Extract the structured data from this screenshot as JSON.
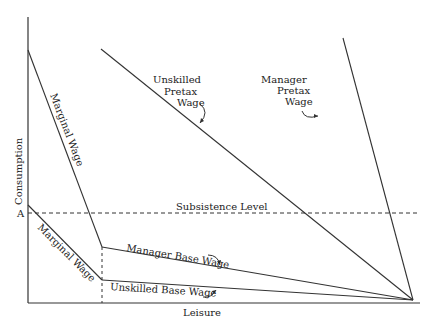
{
  "diagram": {
    "axes": {
      "y_label": "Consumption",
      "x_label": "Leisure",
      "y_tick_label": "A"
    },
    "lines": {
      "subsistence": "Subsistence Level",
      "upper_marginal_wage": "Marginal Wage",
      "lower_marginal_wage": "Marginal Wage",
      "manager_base_wage": "Manager Base Wage",
      "unskilled_base_wage": "Unskilled Base Wage",
      "unskilled_pretax": [
        "Unskilled",
        "Pretax",
        "Wage"
      ],
      "manager_pretax": [
        "Manager",
        "Pretax",
        "Wage"
      ]
    },
    "colors": {
      "line": "#333333",
      "background": "#ffffff"
    }
  }
}
